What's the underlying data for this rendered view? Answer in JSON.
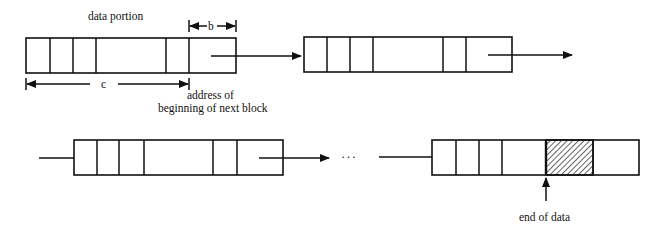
{
  "diagram": {
    "type": "linked-list-of-blocks",
    "labels": {
      "data_portion": "data portion",
      "b": "b",
      "c": "c",
      "address_line1": "address of",
      "address_line2": "beginning of next block",
      "ellipsis": "···",
      "end_of_data": "end of data"
    },
    "blocks": [
      {
        "id": "block-1",
        "x": 26,
        "y": 38,
        "w": 210,
        "h": 35,
        "dividers": [
          50,
          73,
          96,
          166,
          189
        ],
        "hatched": null,
        "pointer": true
      },
      {
        "id": "block-2",
        "x": 304,
        "y": 37,
        "w": 208,
        "h": 35,
        "dividers": [
          327,
          350,
          373,
          443,
          466
        ],
        "hatched": null,
        "pointer": true
      },
      {
        "id": "block-3",
        "x": 74,
        "y": 140,
        "w": 209,
        "h": 35,
        "dividers": [
          97,
          119,
          144,
          213,
          237
        ],
        "hatched": null,
        "pointer": true
      },
      {
        "id": "block-4",
        "x": 432,
        "y": 140,
        "w": 207,
        "h": 35,
        "dividers": [
          456,
          479,
          502,
          546,
          593
        ],
        "hatched": [
          546,
          593
        ],
        "pointer": false
      }
    ],
    "colors": {
      "stroke": "#111111",
      "background": "#ffffff"
    }
  }
}
